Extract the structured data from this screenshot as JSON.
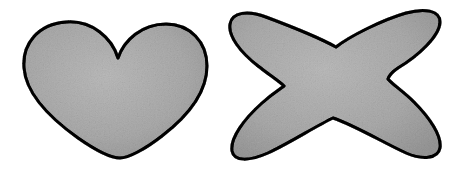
{
  "canvas": {
    "width": 460,
    "height": 170,
    "background_color": "#ffffff",
    "description": "Two hand-drawn filled outline shapes side by side on a white background"
  },
  "style": {
    "fill_color": "#cdcdcd",
    "fill_color_light": "#d9d9d9",
    "fill_color_dark": "#c2c2c2",
    "stroke_color": "#151515",
    "stroke_width": 3,
    "texture": "speckled-paper-grain"
  },
  "shapes": [
    {
      "id": "heart",
      "name": "heart-shape",
      "label": "Heart",
      "fill_color": "#cdcdcd",
      "stroke_color": "#151515",
      "stroke_width": 3,
      "bounds": {
        "x": 22,
        "y": 20,
        "width": 186,
        "height": 140
      },
      "notch_point": {
        "x": 118,
        "y": 58
      },
      "bottom_point": {
        "x": 120,
        "y": 158
      },
      "path": "M 118 58 C 112 38 92 20 66 22 C 38 24 22 44 24 68 C 26 94 50 118 78 138 C 98 152 112 158 120 158 C 128 158 144 150 162 136 C 188 116 207 92 207 66 C 207 42 190 24 166 24 C 142 24 124 40 118 58 Z"
    },
    {
      "id": "four-point-star",
      "name": "x-star-shape",
      "label": "Four-pointed star",
      "fill_color": "#cdcdcd",
      "stroke_color": "#151515",
      "stroke_width": 3,
      "bounds": {
        "x": 230,
        "y": 10,
        "width": 212,
        "height": 152
      },
      "center": {
        "x": 334,
        "y": 84
      },
      "notches": [
        {
          "name": "top-notch",
          "x": 336,
          "y": 47
        },
        {
          "name": "left-notch",
          "x": 284,
          "y": 86
        },
        {
          "name": "right-notch",
          "x": 388,
          "y": 79
        },
        {
          "name": "bottom-notch",
          "x": 333,
          "y": 118
        }
      ],
      "arm_tips": [
        {
          "name": "top-left-tip",
          "x": 238,
          "y": 16
        },
        {
          "name": "top-right-tip",
          "x": 434,
          "y": 14
        },
        {
          "name": "bottom-left-tip",
          "x": 236,
          "y": 156
        },
        {
          "name": "bottom-right-tip",
          "x": 438,
          "y": 154
        }
      ],
      "path": "M 336 47 C 350 36 382 20 406 13 C 424 8 440 10 440 22 C 440 36 418 56 398 68 C 392 72 389 76 388 79 C 392 84 404 92 414 102 C 430 118 442 136 440 148 C 438 159 422 160 406 153 C 384 143 354 125 333 118 C 316 126 288 144 268 153 C 250 161 234 162 232 151 C 230 138 244 119 262 103 C 272 94 280 89 284 86 C 279 81 268 74 258 66 C 240 52 228 36 230 24 C 232 12 248 10 266 17 C 290 26 320 38 336 47 Z"
    }
  ]
}
